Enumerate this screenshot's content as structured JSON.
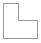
{
  "canvas": {
    "width": 41,
    "height": 43,
    "background_color": "#ffffff"
  },
  "shape": {
    "name": "l-shape-outline",
    "label": "L-shaped polygon outline",
    "type": "polygon",
    "stroke_color": "#9a9a9a",
    "stroke_width": 1,
    "fill_color": "#ffffff",
    "points": "3.5,3.5 18.5,3.5 18.5,20.5 37.5,20.5 37.5,38.5 3.5,38.5",
    "vertices": [
      {
        "x": 3,
        "y": 3
      },
      {
        "x": 18,
        "y": 3
      },
      {
        "x": 18,
        "y": 20
      },
      {
        "x": 37,
        "y": 20
      },
      {
        "x": 37,
        "y": 38
      },
      {
        "x": 3,
        "y": 38
      }
    ],
    "edges": [
      {
        "name": "top-edge",
        "from": [
          3,
          3
        ],
        "to": [
          18,
          3
        ]
      },
      {
        "name": "upper-right-edge",
        "from": [
          18,
          3
        ],
        "to": [
          18,
          20
        ]
      },
      {
        "name": "inner-notch-edge",
        "from": [
          18,
          20
        ],
        "to": [
          37,
          20
        ]
      },
      {
        "name": "right-edge",
        "from": [
          37,
          20
        ],
        "to": [
          37,
          38
        ]
      },
      {
        "name": "bottom-edge",
        "from": [
          37,
          38
        ],
        "to": [
          3,
          38
        ]
      },
      {
        "name": "left-edge",
        "from": [
          3,
          38
        ],
        "to": [
          3,
          3
        ]
      }
    ]
  }
}
